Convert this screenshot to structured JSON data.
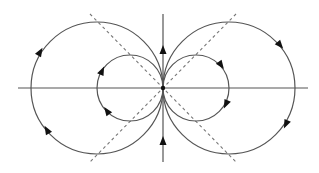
{
  "diagram": {
    "title": "",
    "type": "field-line diagram (dipole-like circles)",
    "origin": {
      "x": 163,
      "y": 88
    },
    "colors": {
      "line": "#555555",
      "dashed": "#777777",
      "arrow": "#111111",
      "background": "#ffffff"
    },
    "axes": {
      "horizontal": {
        "x1": 18,
        "y1": 88,
        "x2": 308,
        "y2": 88
      },
      "vertical": {
        "x1": 163,
        "y1": 14,
        "x2": 163,
        "y2": 162
      }
    },
    "dashed_lines": [
      {
        "x1": 90,
        "y1": 14,
        "x2": 236,
        "y2": 162
      },
      {
        "x1": 236,
        "y1": 14,
        "x2": 90,
        "y2": 162
      }
    ],
    "circles": [
      {
        "name": "left-large",
        "cx": 97,
        "cy": 88,
        "r": 66
      },
      {
        "name": "right-large",
        "cx": 229,
        "cy": 88,
        "r": 66
      },
      {
        "name": "left-small",
        "cx": 130,
        "cy": 88,
        "r": 33
      },
      {
        "name": "right-small",
        "cx": 196,
        "cy": 88,
        "r": 33
      }
    ],
    "arrows": [
      {
        "name": "vertical-top",
        "x": 163,
        "y": 50,
        "angle": -90
      },
      {
        "name": "vertical-bottom",
        "x": 163,
        "y": 141,
        "angle": -90
      },
      {
        "name": "left-large-upper",
        "x": 40,
        "y": 52,
        "angle": -60
      },
      {
        "name": "left-large-lower",
        "x": 47,
        "y": 130,
        "angle": -120
      },
      {
        "name": "left-small-upper",
        "x": 102,
        "y": 71,
        "angle": -65
      },
      {
        "name": "left-small-lower",
        "x": 107,
        "y": 111,
        "angle": -125
      },
      {
        "name": "right-large-upper",
        "x": 280,
        "y": 45,
        "angle": 50
      },
      {
        "name": "right-large-lower",
        "x": 286,
        "y": 124,
        "angle": 115
      },
      {
        "name": "right-small-upper",
        "x": 221,
        "y": 65,
        "angle": 55
      },
      {
        "name": "right-small-lower",
        "x": 226,
        "y": 104,
        "angle": 115
      }
    ]
  }
}
